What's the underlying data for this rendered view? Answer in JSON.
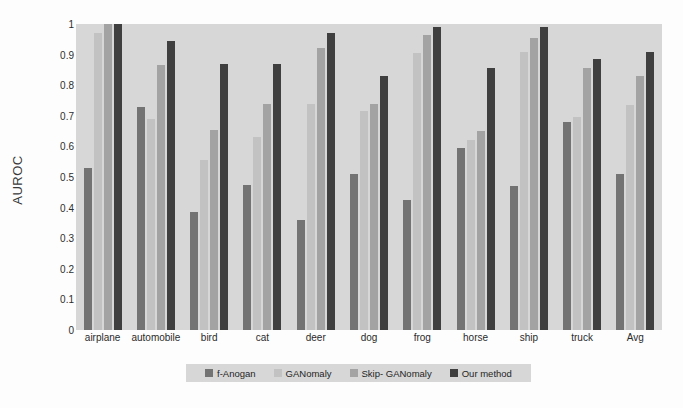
{
  "chart_data": {
    "type": "bar",
    "title": "",
    "xlabel": "",
    "ylabel": "AUROC",
    "ylim": [
      0,
      1
    ],
    "grid": false,
    "legend_position": "bottom",
    "categories": [
      "airplane",
      "automobile",
      "bird",
      "cat",
      "deer",
      "dog",
      "frog",
      "horse",
      "ship",
      "truck",
      "Avg"
    ],
    "ytick_labels": [
      "0",
      "0.1",
      "0.2",
      "0.3",
      "0.4",
      "0.5",
      "0.6",
      "0.7",
      "0.8",
      "0.9",
      "1"
    ],
    "ytick_values": [
      0,
      0.1,
      0.2,
      0.3,
      0.4,
      0.5,
      0.6,
      0.7,
      0.8,
      0.9,
      1
    ],
    "series": [
      {
        "name": "f-Anogan",
        "color": "#737373",
        "values": [
          0.53,
          0.73,
          0.385,
          0.475,
          0.36,
          0.51,
          0.425,
          0.595,
          0.47,
          0.68,
          0.51
        ]
      },
      {
        "name": "GANomaly",
        "color": "#c2c2c2",
        "values": [
          0.97,
          0.69,
          0.555,
          0.63,
          0.74,
          0.715,
          0.905,
          0.62,
          0.91,
          0.695,
          0.735
        ]
      },
      {
        "name": "Skip- GANomaly",
        "color": "#a3a3a3",
        "values": [
          1.0,
          0.865,
          0.655,
          0.74,
          0.92,
          0.74,
          0.965,
          0.65,
          0.955,
          0.855,
          0.83
        ]
      },
      {
        "name": "Our method",
        "color": "#3f3f3f",
        "values": [
          1.0,
          0.945,
          0.87,
          0.87,
          0.97,
          0.83,
          0.99,
          0.855,
          0.99,
          0.885,
          0.91
        ]
      }
    ]
  },
  "plot": {
    "background_color": "#d7d7d7",
    "figure_background_color": "#fdfdfd",
    "legend_background_color": "#d7d7d7"
  }
}
